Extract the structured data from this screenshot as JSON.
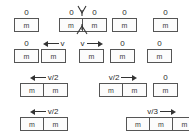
{
  "diagram": {
    "mass_label": "m",
    "zero_label": "0",
    "colors": {
      "background": "#ffffff",
      "box_border": "#555555",
      "box_fill": "#fcfcfc",
      "text": "#2b2b2b",
      "arrow": "#333333"
    },
    "icons": {
      "arrow_left": "arrow-left-icon",
      "arrow_right": "arrow-right-icon",
      "burst": "explosion-burst-icon"
    },
    "rows": [
      {
        "row_id": "row-1",
        "groups": [
          {
            "label": "0",
            "label_kind": "zero",
            "cells": [
              "m"
            ]
          },
          {
            "label": "0",
            "label_kind": "zero-pair",
            "label2": "0",
            "cells": [
              "m",
              "m"
            ],
            "burst": true
          },
          {
            "label": "0",
            "label_kind": "zero",
            "cells": [
              "m"
            ]
          },
          {
            "label": "0",
            "label_kind": "zero",
            "cells": [
              "m"
            ]
          }
        ]
      },
      {
        "row_id": "row-2",
        "groups": [
          {
            "label": "0",
            "label_kind": "zero",
            "cells": [
              "m"
            ]
          },
          {
            "label": "v",
            "label_kind": "arrow-left",
            "cells": [
              "m"
            ]
          },
          {
            "label": "v",
            "label_kind": "arrow-right",
            "cells": [
              "m"
            ]
          },
          {
            "label": "0",
            "label_kind": "zero",
            "cells": [
              "m"
            ]
          },
          {
            "label": "0",
            "label_kind": "zero",
            "cells": [
              "m"
            ]
          }
        ]
      },
      {
        "row_id": "row-3",
        "groups": [
          {
            "label": "v/2",
            "label_kind": "arrow-left",
            "cells": [
              "m",
              "m"
            ]
          },
          {
            "label": "v/2",
            "label_kind": "arrow-right",
            "cells": [
              "m",
              "m"
            ]
          },
          {
            "label": "0",
            "label_kind": "zero",
            "cells": [
              "m"
            ]
          }
        ]
      },
      {
        "row_id": "row-4",
        "groups": [
          {
            "label": "v/2",
            "label_kind": "arrow-left",
            "cells": [
              "m",
              "m"
            ]
          },
          {
            "label": "v/3",
            "label_kind": "arrow-right",
            "cells": [
              "m",
              "m",
              "m"
            ]
          }
        ]
      }
    ]
  }
}
